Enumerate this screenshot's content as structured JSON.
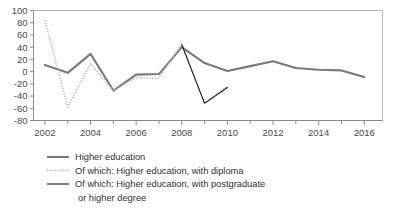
{
  "chart_data": {
    "type": "line",
    "title": "",
    "subtitle": "",
    "xlabel": "",
    "ylabel": "",
    "x": [
      2002,
      2003,
      2004,
      2005,
      2006,
      2007,
      2008,
      2009,
      2010,
      2011,
      2012,
      2013,
      2014,
      2015,
      2016
    ],
    "xlim": [
      2001.5,
      2016.8
    ],
    "ylim": [
      -80,
      100
    ],
    "x_tick_labels": [
      "2002",
      "2004",
      "2006",
      "2008",
      "2010",
      "2012",
      "2014",
      "2016"
    ],
    "x_tick_values": [
      2002,
      2004,
      2006,
      2008,
      2010,
      2012,
      2014,
      2016
    ],
    "x_minor_tick_values": [
      2003,
      2005,
      2007,
      2009,
      2011,
      2013,
      2015
    ],
    "y_tick_labels": [
      "100",
      "80",
      "60",
      "40",
      "20",
      "0",
      "-20",
      "-40",
      "-60",
      "-80"
    ],
    "y_tick_values": [
      100,
      80,
      60,
      40,
      20,
      0,
      -20,
      -40,
      -60,
      -80
    ],
    "grid": false,
    "legend_position": "bottom-left",
    "series": [
      {
        "name": "Higher education",
        "style": "solid",
        "color": "#7a7a7a",
        "width": 2.1,
        "x": [
          2002,
          2003,
          2004,
          2005,
          2006,
          2007,
          2008,
          2009,
          2010,
          2011,
          2012,
          2013,
          2014,
          2015,
          2016
        ],
        "values": [
          11,
          -2,
          29,
          -31,
          -5,
          -4,
          40,
          14,
          1,
          9,
          17,
          6,
          3,
          2,
          -9
        ]
      },
      {
        "name": "Of which: Higher education, with diploma",
        "style": "dotted",
        "color": "#b5b5b5",
        "width": 1.6,
        "x": [
          2002,
          2003,
          2004,
          2005,
          2006,
          2007,
          2008,
          2009,
          2010
        ],
        "values": [
          84,
          -58,
          13,
          -31,
          -10,
          -11,
          46,
          -51,
          -24
        ]
      },
      {
        "name": "Of which: Higher education, with postgraduate or higher degree",
        "style": "solid",
        "color": "#1a1a1a",
        "width": 1.1,
        "x": [
          2008,
          2009,
          2010
        ],
        "values": [
          44,
          -52,
          -26
        ]
      }
    ]
  },
  "legend": {
    "items": [
      {
        "label": "Higher education"
      },
      {
        "label": "Of which: Higher education, with diploma"
      },
      {
        "label": "Of which: Higher education, with postgraduate"
      },
      {
        "label": "or higher degree"
      }
    ]
  }
}
